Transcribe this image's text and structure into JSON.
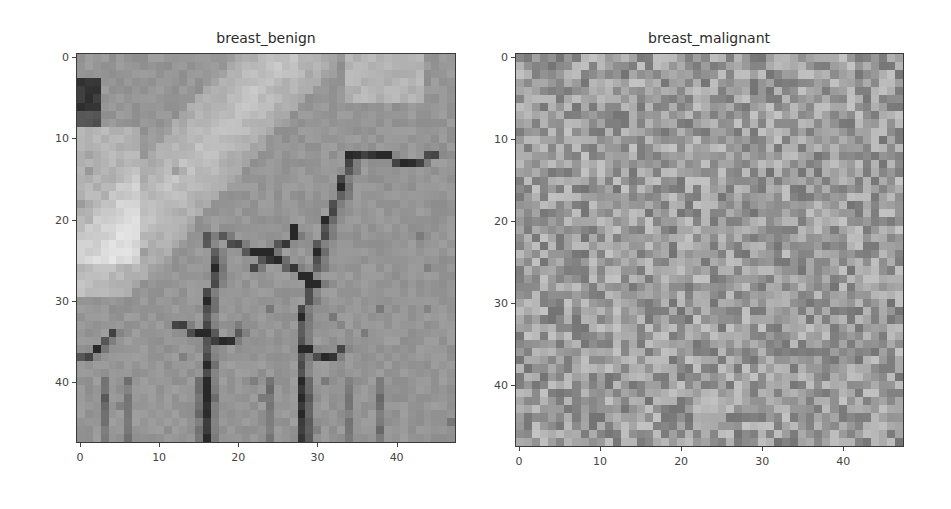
{
  "chart_data": [
    {
      "type": "heatmap",
      "title": "breast_benign",
      "colormap": "gray",
      "image_size": [
        48,
        48
      ],
      "xlabel": "",
      "ylabel": "",
      "xlim": [
        -0.5,
        47.5
      ],
      "ylim": [
        47.5,
        -0.5
      ],
      "x_ticks": [
        0,
        10,
        20,
        30,
        40
      ],
      "y_ticks": [
        0,
        10,
        20,
        30,
        40
      ],
      "grid": false,
      "description": "Smooth tissue texture: bright diagonal band in upper-left, dark block at top-left (rows 3-8, cols 0-2), dark branching vessel-like strands through center (cols ~15-35, rows ~12-48), vertical dark streaks at bottom",
      "texture": "benign",
      "seed": 7
    },
    {
      "type": "heatmap",
      "title": "breast_malignant",
      "colormap": "gray",
      "image_size": [
        48,
        48
      ],
      "xlabel": "",
      "ylabel": "",
      "xlim": [
        -0.5,
        47.5
      ],
      "ylim": [
        47.5,
        -0.5
      ],
      "x_ticks": [
        0,
        10,
        20,
        30,
        40
      ],
      "y_ticks": [
        0,
        10,
        20,
        30,
        40
      ],
      "grid": false,
      "description": "High-frequency random speckle noise with uniform mid-gray intensity and no coherent structure",
      "texture": "malignant",
      "seed": 42
    }
  ],
  "panels": [
    {
      "title": "breast_benign",
      "x_tick_labels": [
        "0",
        "10",
        "20",
        "30",
        "40"
      ],
      "y_tick_labels": [
        "0",
        "10",
        "20",
        "30",
        "40"
      ]
    },
    {
      "title": "breast_malignant",
      "x_tick_labels": [
        "0",
        "10",
        "20",
        "30",
        "40"
      ],
      "y_tick_labels": [
        "0",
        "10",
        "20",
        "30",
        "40"
      ]
    }
  ],
  "colors": {
    "background": "#ffffff",
    "axes_border": "#3a3a3a",
    "tick_text": "#444444",
    "title_text": "#2b2b2b"
  }
}
